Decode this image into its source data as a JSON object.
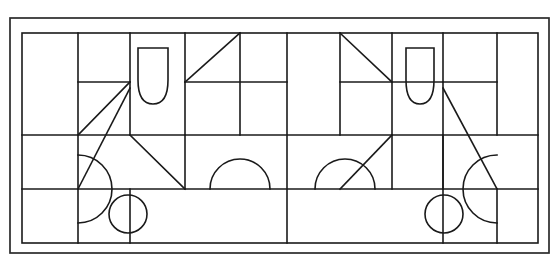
{
  "figure": {
    "domain_note": "Black-and-white geometric line drawing",
    "canvas": {
      "width": 559,
      "height": 257
    },
    "colors": {
      "background": "#ffffff",
      "line": "#1a1a1a",
      "outer_line": "#2b2b2b"
    },
    "outer_frame": {
      "x1": 10,
      "y1": 18,
      "x2": 549,
      "y2": 253,
      "label": "outer-border"
    },
    "inner_frame": {
      "x1": 22,
      "y1": 33,
      "x2": 538,
      "y2": 243,
      "label": "inner-grid-border"
    },
    "grid": {
      "vertical_lines": [
        22,
        78,
        130,
        185,
        240,
        287,
        340,
        392,
        443,
        497,
        538
      ],
      "horizontal_lines": [
        33,
        135,
        189,
        243
      ],
      "partial_horizontal_segments": [
        {
          "y": 82,
          "x1": 78,
          "x2": 130,
          "name": "left-short-divider"
        },
        {
          "y": 82,
          "x1": 185,
          "x2": 287,
          "name": "upper-middle-divider"
        },
        {
          "y": 82,
          "x1": 443,
          "x2": 497,
          "name": "right-short-divider"
        }
      ],
      "partial_vertical_segments": [
        {
          "x": 130,
          "y1": 33,
          "y2": 135,
          "name": "left-upper-vertical"
        },
        {
          "x": 185,
          "y1": 135,
          "y2": 189,
          "name": "left-lower-vertical"
        },
        {
          "x": 443,
          "y1": 135,
          "y2": 189,
          "name": "right-lower-vertical"
        }
      ]
    },
    "shapes": [
      {
        "name": "triangle-upper-left-diagonal",
        "type": "line",
        "points": "78,135 130,82",
        "description": "diagonal rising to the right in upper-left area"
      },
      {
        "name": "bullet-shape-left",
        "type": "rounded-bullet",
        "x": 138,
        "y": 46,
        "width": 30,
        "height": 58,
        "description": "vertical capsule with flat top and pointed rounded bottom"
      },
      {
        "name": "triangle-top-left-of-center",
        "type": "triangle",
        "points": "185,82 240,33 240,82",
        "description": "right triangle, hypotenuse from lower-left to upper-right"
      },
      {
        "name": "triangle-top-right-of-center",
        "type": "triangle",
        "points": "340,33 340,82 392,82",
        "description": "right triangle, hypotenuse from upper-left to lower-right"
      },
      {
        "name": "bullet-shape-right",
        "type": "rounded-bullet",
        "x": 406,
        "y": 46,
        "width": 28,
        "height": 58,
        "description": "vertical capsule with flat top and pointed rounded bottom"
      },
      {
        "name": "triangle-large-left",
        "type": "triangle",
        "points": "78,189 130,88 130,189",
        "description": "large right triangle pointing up, left half"
      },
      {
        "name": "triangle-medium-left",
        "type": "triangle",
        "points": "130,135 185,189 130,189",
        "description": "right triangle with hypotenuse descending to the right"
      },
      {
        "name": "triangle-medium-right",
        "type": "triangle",
        "points": "340,189 392,135 392,189",
        "description": "right triangle with hypotenuse ascending to the right"
      },
      {
        "name": "triangle-large-right",
        "type": "triangle",
        "points": "443,88 497,189 443,189",
        "description": "large right triangle pointing up, right half"
      },
      {
        "name": "semicircle-left-edge",
        "type": "semicircle",
        "cx": 78,
        "cy": 189,
        "r": 34,
        "orientation": "open-left",
        "description": "half disc bulging rightwards from the left inner vertical line"
      },
      {
        "name": "semicircle-middle-left",
        "type": "semicircle",
        "cx": 240,
        "cy": 189,
        "r": 30,
        "orientation": "up",
        "description": "half disc bulging upward sitting on the horizontal line"
      },
      {
        "name": "semicircle-middle-right",
        "type": "semicircle",
        "cx": 313,
        "cy": 189,
        "r": 30,
        "orientation": "up",
        "description": "half disc bulging upward sitting on the horizontal line"
      },
      {
        "name": "semicircle-right-edge",
        "type": "semicircle",
        "cx": 497,
        "cy": 189,
        "r": 34,
        "orientation": "open-right",
        "description": "half disc bulging leftwards from the right inner vertical line"
      },
      {
        "name": "circle-lower-left",
        "type": "circle",
        "cx": 128,
        "cy": 214,
        "r": 19,
        "description": "small circle in the lower-left band"
      },
      {
        "name": "circle-lower-right",
        "type": "circle",
        "cx": 444,
        "cy": 214,
        "r": 19,
        "description": "small circle in the lower-right band"
      }
    ]
  }
}
